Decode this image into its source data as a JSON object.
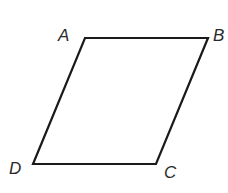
{
  "figure": {
    "type": "parallelogram",
    "stroke_color": "#1a1a1a",
    "stroke_width": 2.2,
    "vertices": [
      {
        "label": "A",
        "x": 85,
        "y": 38
      },
      {
        "label": "B",
        "x": 208,
        "y": 38
      },
      {
        "label": "C",
        "x": 156,
        "y": 164
      },
      {
        "label": "D",
        "x": 33,
        "y": 164
      }
    ]
  },
  "labels": {
    "A": "A",
    "B": "B",
    "C": "C",
    "D": "D"
  }
}
